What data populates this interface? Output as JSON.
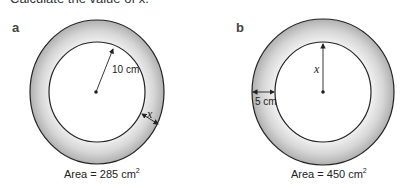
{
  "instruction": "Calculate the value of x.",
  "parts": [
    {
      "label": "a",
      "given_label": "10 cm",
      "given_meaning": "inner radius",
      "unknown_label": "x",
      "unknown_meaning": "ring width",
      "area_prefix": "Area = 285 cm",
      "area_sup": "2"
    },
    {
      "label": "b",
      "given_label": "5 cm",
      "given_meaning": "ring width",
      "unknown_label": "x",
      "unknown_meaning": "inner radius",
      "area_prefix": "Area = 450 cm",
      "area_sup": "2"
    }
  ],
  "colors": {
    "ring_light": "#f4f4f4",
    "ring_dark": "#b8b8b8",
    "stroke": "#222222"
  }
}
